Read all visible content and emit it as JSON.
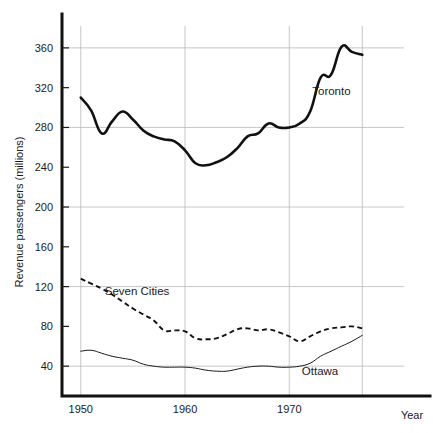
{
  "chart_data": {
    "type": "line",
    "title": "",
    "xlabel": "Year",
    "ylabel": "Revenue passengers (millions)",
    "xlim": [
      1948.2,
      1981.0
    ],
    "ylim": [
      10,
      382
    ],
    "grid": true,
    "grid_x_values": [
      1950,
      1960,
      1970,
      1977
    ],
    "grid_y_values": [
      40,
      120,
      200,
      280,
      360
    ],
    "x_tick_labels": [
      "1950",
      "1960",
      "1970"
    ],
    "x_tick_values": [
      1950,
      1960,
      1970
    ],
    "y_tick_labels": [
      "40",
      "80",
      "120",
      "160",
      "200",
      "240",
      "280",
      "320",
      "360"
    ],
    "y_tick_values": [
      40,
      80,
      120,
      160,
      200,
      240,
      280,
      320,
      360
    ],
    "legend_position": "inline-annotations",
    "x": [
      1950,
      1951,
      1952,
      1953,
      1954,
      1955,
      1956,
      1957,
      1958,
      1959,
      1960,
      1961,
      1962,
      1963,
      1964,
      1965,
      1966,
      1967,
      1968,
      1969,
      1970,
      1971,
      1972,
      1973,
      1974,
      1975,
      1976,
      1977
    ],
    "series": [
      {
        "name": "Toronto",
        "style": "solid-thick",
        "values": [
          310,
          297,
          274,
          286,
          296,
          288,
          277,
          271,
          268,
          266,
          257,
          244,
          242,
          245,
          250,
          259,
          271,
          274,
          284,
          280,
          280,
          284,
          296,
          330,
          333,
          361,
          356,
          353
        ]
      },
      {
        "name": "Seven Cities",
        "style": "dashed",
        "values": [
          128,
          123,
          118,
          112,
          105,
          98,
          92,
          86,
          76,
          76,
          75,
          68,
          67,
          68,
          72,
          77,
          78,
          76,
          77,
          74,
          70,
          65,
          70,
          75,
          78,
          79,
          80,
          78
        ]
      },
      {
        "name": "Ottawa",
        "style": "solid-thin",
        "values": [
          55,
          56,
          53,
          50,
          48,
          46,
          42,
          40,
          39,
          39,
          39,
          38,
          36,
          35,
          35,
          37,
          39,
          40,
          40,
          39,
          39,
          40,
          43,
          50,
          55,
          60,
          65,
          71
        ]
      }
    ],
    "annotations": [
      {
        "text": "Toronto",
        "x": 1972.2,
        "y": 313
      },
      {
        "text": "Seven Cities",
        "x": 1952.3,
        "y": 112
      },
      {
        "text": "Ottawa",
        "x": 1971.2,
        "y": 31
      }
    ]
  },
  "axes": {
    "y_axis_title": "Revenue passengers (millions)",
    "x_axis_title": "Year"
  },
  "colors": {
    "line": "#111111",
    "grid": "#b9b9b9",
    "text": "#1a1a1a",
    "background": "#ffffff"
  }
}
